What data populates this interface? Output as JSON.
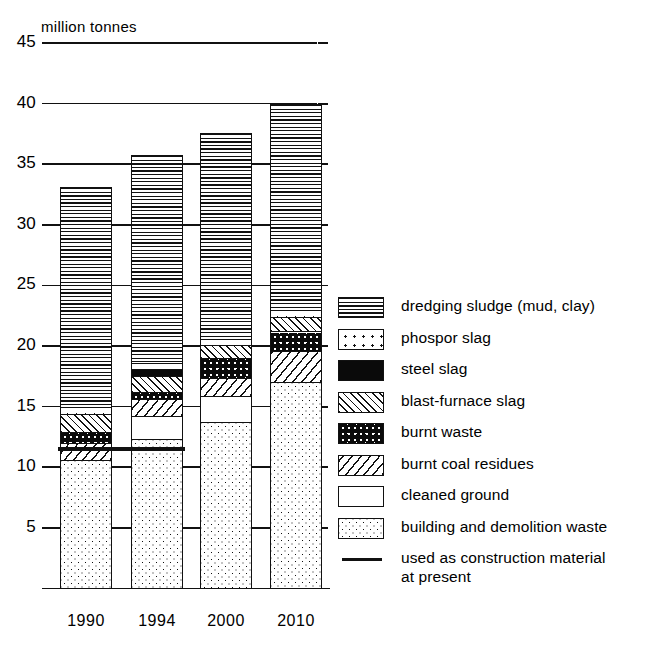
{
  "chart_data": {
    "type": "bar",
    "subtype": "stacked-bar",
    "title": "",
    "unit_label": "million tonnes",
    "xlabel": "",
    "ylabel": "",
    "categories": [
      "1990",
      "1994",
      "2000",
      "2010"
    ],
    "ylim": [
      0,
      45
    ],
    "yticks": [
      5,
      10,
      15,
      20,
      25,
      30,
      35,
      40,
      45
    ],
    "grid": true,
    "legend_position": "right",
    "totals": [
      33.1,
      35.8,
      37.6,
      40.0
    ],
    "series": [
      {
        "name": "building and demolition waste",
        "pattern": "fine-dots",
        "values": [
          10.6,
          12.3,
          13.7,
          17.0
        ]
      },
      {
        "name": "cleaned ground",
        "pattern": "white",
        "values": [
          0.0,
          1.9,
          2.2,
          0.0
        ]
      },
      {
        "name": "burnt coal residues",
        "pattern": "diagonal",
        "values": [
          1.4,
          1.4,
          1.5,
          2.6
        ]
      },
      {
        "name": "burnt waste",
        "pattern": "burnt",
        "values": [
          0.9,
          0.6,
          1.6,
          1.6
        ]
      },
      {
        "name": "blast-furnace slag",
        "pattern": "crosshatch",
        "values": [
          1.5,
          1.3,
          1.1,
          1.2
        ]
      },
      {
        "name": "steel slag",
        "pattern": "solid",
        "values": [
          0.0,
          0.6,
          0.0,
          0.0
        ]
      },
      {
        "name": "phospor slag",
        "pattern": "coarse-dots",
        "values": [
          0.6,
          0.5,
          0.5,
          0.6
        ]
      },
      {
        "name": "dredging sludge (mud, clay)",
        "pattern": "horizontal",
        "values": [
          18.1,
          17.2,
          17.0,
          17.0
        ]
      }
    ],
    "annotations": [
      {
        "name": "used as construction material at present",
        "type": "horizontal-line",
        "value": 11.5,
        "spans": [
          "1990",
          "1994"
        ]
      }
    ]
  },
  "legend": {
    "items": [
      {
        "label": "dredging sludge (mud, clay)",
        "pattern": "horizontal"
      },
      {
        "label": "phospor slag",
        "pattern": "coarse-dots"
      },
      {
        "label": "steel slag",
        "pattern": "solid"
      },
      {
        "label": "blast-furnace slag",
        "pattern": "crosshatch"
      },
      {
        "label": "burnt waste",
        "pattern": "burnt"
      },
      {
        "label": "burnt coal residues",
        "pattern": "diagonal"
      },
      {
        "label": "cleaned ground",
        "pattern": "white"
      },
      {
        "label": "building and demolition waste",
        "pattern": "fine-dots"
      }
    ],
    "line_item": {
      "label_line1": "used as construction material",
      "label_line2": "at present"
    }
  },
  "axis": {
    "unit": "million tonnes",
    "y_labels": [
      "45",
      "40",
      "35",
      "30",
      "25",
      "20",
      "15",
      "10",
      "5"
    ],
    "x_labels": [
      "1990",
      "1994",
      "2000",
      "2010"
    ]
  },
  "colors": {
    "ink": "#111111",
    "paper": "#ffffff"
  }
}
